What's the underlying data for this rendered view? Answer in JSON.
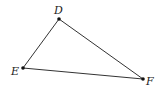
{
  "diagram": {
    "type": "triangle",
    "stroke_color": "#333333",
    "points": [
      {
        "id": "D",
        "label": "D",
        "x": 59,
        "y": 19
      },
      {
        "id": "E",
        "label": "E",
        "x": 23,
        "y": 68
      },
      {
        "id": "F",
        "label": "F",
        "x": 143,
        "y": 79
      }
    ],
    "segments": [
      {
        "from": "D",
        "to": "E"
      },
      {
        "from": "D",
        "to": "F"
      },
      {
        "from": "E",
        "to": "F"
      }
    ]
  }
}
